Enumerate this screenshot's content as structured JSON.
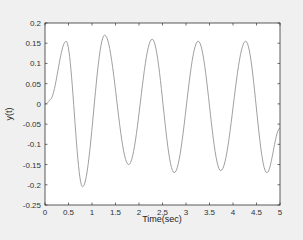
{
  "chart_data": {
    "type": "line",
    "title": "",
    "xlabel": "Time(sec)",
    "ylabel": "y(t)",
    "xlim": [
      0,
      5
    ],
    "ylim": [
      -0.25,
      0.2
    ],
    "xticks": [
      0,
      0.5,
      1,
      1.5,
      2,
      2.5,
      3,
      3.5,
      4,
      4.5,
      5
    ],
    "xtick_labels": [
      "0",
      "0.5",
      "1",
      "1.5",
      "2",
      "2.5",
      "3",
      "3.5",
      "4",
      "4.5",
      "5"
    ],
    "yticks": [
      -0.25,
      -0.2,
      -0.15,
      -0.1,
      -0.05,
      0,
      0.05,
      0.1,
      0.15,
      0.2
    ],
    "ytick_labels": [
      "-0.25",
      "-0.2",
      "-0.15",
      "-0.1",
      "-0.05",
      "0",
      "0.05",
      "0.1",
      "0.15",
      "0.2"
    ],
    "grid": false,
    "legend": null,
    "series": [
      {
        "name": "y(t)",
        "color": "#a0a0a0",
        "keypoints": [
          [
            0,
            0
          ],
          [
            0.1,
            0.01
          ],
          [
            0.45,
            0.155
          ],
          [
            0.8,
            -0.205
          ],
          [
            1.27,
            0.17
          ],
          [
            1.78,
            -0.15
          ],
          [
            2.28,
            0.16
          ],
          [
            2.75,
            -0.17
          ],
          [
            3.26,
            0.155
          ],
          [
            3.74,
            -0.165
          ],
          [
            4.27,
            0.155
          ],
          [
            4.72,
            -0.17
          ],
          [
            5.0,
            -0.06
          ]
        ]
      }
    ]
  },
  "colors": {
    "figure_bg": "#f0f0f0",
    "axes_bg": "#ffffff",
    "axis_line": "#333333",
    "line": "#a0a0a0"
  }
}
